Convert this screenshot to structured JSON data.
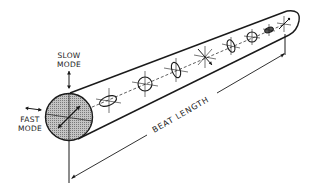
{
  "diagram": {
    "labels": {
      "slow_mode_line1": "SLOW",
      "slow_mode_line2": "MODE",
      "fast_mode_line1": "FAST",
      "fast_mode_line2": "MODE",
      "beat_length": "BEAT LENGTH"
    },
    "elements": {
      "fiber_cross_section": "shaded-circle-with-axes",
      "polarization_states": [
        {
          "index": 0,
          "shape": "linear-45deg",
          "x": 69,
          "y": 117
        },
        {
          "index": 1,
          "shape": "ellipse-horizontal",
          "x": 108,
          "y": 101
        },
        {
          "index": 2,
          "shape": "circle",
          "x": 145,
          "y": 84
        },
        {
          "index": 3,
          "shape": "ellipse-vertical",
          "x": 176,
          "y": 70
        },
        {
          "index": 4,
          "shape": "linear-135deg",
          "x": 205,
          "y": 57
        },
        {
          "index": 5,
          "shape": "ellipse-vertical",
          "x": 231,
          "y": 46
        },
        {
          "index": 6,
          "shape": "circle",
          "x": 252,
          "y": 37
        },
        {
          "index": 7,
          "shape": "ellipse-horizontal",
          "x": 269,
          "y": 30
        },
        {
          "index": 8,
          "shape": "linear-45deg",
          "x": 284,
          "y": 24
        }
      ]
    },
    "colors": {
      "ink": "#1a1a1a",
      "shading": "#a8a8a8",
      "background": "#ffffff"
    }
  }
}
